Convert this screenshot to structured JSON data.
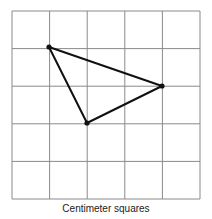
{
  "diagram": {
    "caption": "Centimeter squares",
    "grid": {
      "rows": 5,
      "cols": 5,
      "left": 12,
      "top": 11,
      "cell": 37.6,
      "line_color": "#8a8a8a"
    },
    "triangle": {
      "vertices": [
        [
          49,
          47
        ],
        [
          162,
          86
        ],
        [
          87,
          123
        ]
      ],
      "grid_vertices": [
        [
          1,
          1
        ],
        [
          4,
          2
        ],
        [
          2,
          3
        ]
      ],
      "stroke_color": "#111111"
    }
  }
}
